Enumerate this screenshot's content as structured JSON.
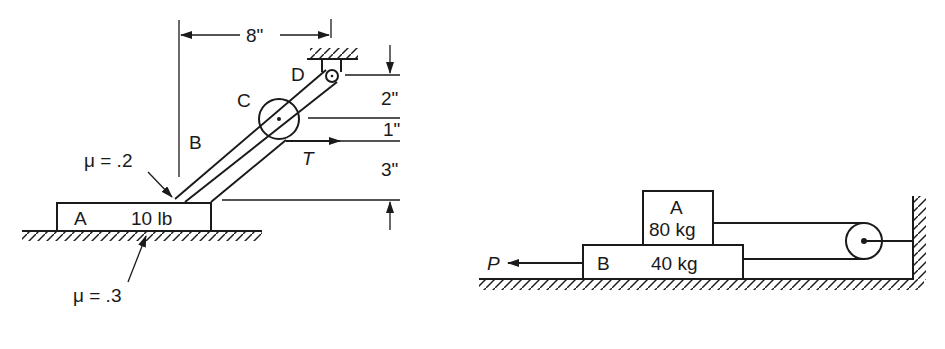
{
  "figure_left": {
    "block_a": {
      "label": "A",
      "weight": "10 lb"
    },
    "bar_label": "B",
    "pulley_label": "C",
    "pin_label": "D",
    "force_label": "T",
    "friction_bar_block": "μ = .2",
    "friction_block_ground": "μ = .3",
    "dimensions": {
      "horizontal": "8\"",
      "vertical_top": "2\"",
      "vertical_mid": "1\"",
      "vertical_bottom": "3\""
    }
  },
  "figure_right": {
    "block_a": {
      "label": "A",
      "mass": "80 kg"
    },
    "block_b": {
      "label": "B",
      "mass": "40 kg"
    },
    "force_label": "P"
  },
  "colors": {
    "ink": "#1a1a1a",
    "background": "#ffffff"
  }
}
